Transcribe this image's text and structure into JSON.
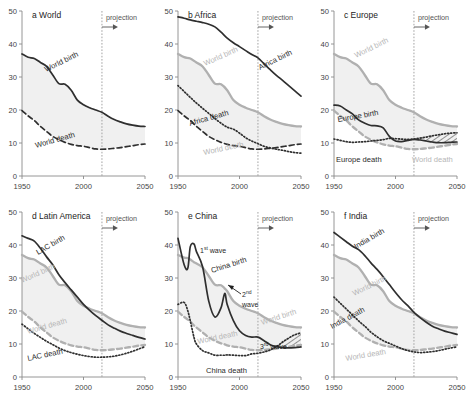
{
  "figure": {
    "width": 469,
    "height": 403,
    "projection_label": "projection",
    "projection_year": 2015,
    "xlim": [
      1950,
      2050
    ],
    "ylim": [
      0,
      50
    ],
    "xticks": [
      1950,
      2000,
      2050
    ],
    "yticks": [
      0,
      10,
      20,
      30,
      40,
      50
    ],
    "colors": {
      "dark": "#2f2f2f",
      "gray": "#b0b0b0",
      "fill": "#f0f0f0",
      "axis": "#8a8a8a"
    }
  },
  "chart_data": [
    {
      "type": "line",
      "panel": "a",
      "title": "a World",
      "xlabel": "",
      "ylabel": "",
      "xlim": [
        1950,
        2050
      ],
      "ylim": [
        0,
        50
      ],
      "grid": false,
      "legend": "inline-labels",
      "x": [
        1950,
        1955,
        1960,
        1965,
        1970,
        1975,
        1980,
        1985,
        1990,
        1995,
        2000,
        2005,
        2010,
        2015,
        2020,
        2025,
        2030,
        2035,
        2040,
        2045,
        2050
      ],
      "series": [
        {
          "name": "World birth",
          "style": "solid-dark",
          "values": [
            37.0,
            36.0,
            35.6,
            34.4,
            33.2,
            30.6,
            28.0,
            27.8,
            26.0,
            23.0,
            21.6,
            20.7,
            20.0,
            19.3,
            18.1,
            17.1,
            16.4,
            15.8,
            15.4,
            15.1,
            15.0
          ]
        },
        {
          "name": "World death",
          "style": "dashed-dark",
          "values": [
            19.8,
            18.2,
            16.8,
            15.0,
            13.5,
            12.0,
            11.0,
            10.2,
            9.6,
            9.2,
            9.0,
            8.6,
            8.2,
            8.1,
            8.2,
            8.4,
            8.6,
            8.9,
            9.2,
            9.5,
            9.7
          ]
        }
      ]
    },
    {
      "type": "line",
      "panel": "b",
      "title": "b Africa",
      "xlim": [
        1950,
        2050
      ],
      "ylim": [
        0,
        50
      ],
      "grid": false,
      "x": [
        1950,
        1955,
        1960,
        1965,
        1970,
        1975,
        1980,
        1985,
        1990,
        1995,
        2000,
        2005,
        2010,
        2015,
        2020,
        2025,
        2030,
        2035,
        2040,
        2045,
        2050
      ],
      "series": [
        {
          "name": "Africa birth",
          "style": "solid-dark",
          "values": [
            48.2,
            47.8,
            47.3,
            46.9,
            46.5,
            46.0,
            45.2,
            43.6,
            41.8,
            40.4,
            39.2,
            38.0,
            36.8,
            35.8,
            34.0,
            32.2,
            30.5,
            29.0,
            27.4,
            25.8,
            24.2
          ]
        },
        {
          "name": "Africa death",
          "style": "dotted-dark",
          "values": [
            27.4,
            25.6,
            23.8,
            22.1,
            20.5,
            19.0,
            17.4,
            16.0,
            14.8,
            14.2,
            13.0,
            11.6,
            10.6,
            9.8,
            9.0,
            8.5,
            8.1,
            7.8,
            7.4,
            7.1,
            6.9
          ]
        },
        {
          "name": "World birth",
          "style": "solid-gray",
          "values": [
            37.0,
            36.0,
            35.6,
            34.4,
            33.2,
            30.6,
            28.0,
            27.8,
            26.0,
            23.0,
            21.6,
            20.7,
            20.0,
            19.3,
            18.1,
            17.1,
            16.4,
            15.8,
            15.4,
            15.1,
            15.0
          ]
        },
        {
          "name": "World death",
          "style": "dashed-dark",
          "values": [
            19.8,
            18.2,
            16.8,
            15.0,
            13.5,
            12.0,
            11.0,
            10.2,
            9.6,
            9.2,
            9.0,
            8.6,
            8.2,
            8.1,
            8.2,
            8.4,
            8.6,
            8.9,
            9.2,
            9.5,
            9.7
          ]
        }
      ]
    },
    {
      "type": "line",
      "panel": "c",
      "title": "c Europe",
      "xlim": [
        1950,
        2050
      ],
      "ylim": [
        0,
        50
      ],
      "grid": false,
      "hatched_region": "death exceeds birth after 2000",
      "x": [
        1950,
        1955,
        1960,
        1965,
        1970,
        1975,
        1980,
        1985,
        1990,
        1995,
        2000,
        2005,
        2010,
        2015,
        2020,
        2025,
        2030,
        2035,
        2040,
        2045,
        2050
      ],
      "series": [
        {
          "name": "Europe birth",
          "style": "solid-dark",
          "values": [
            21.5,
            21.2,
            20.0,
            18.8,
            17.0,
            16.0,
            15.3,
            15.2,
            14.6,
            12.0,
            10.6,
            10.4,
            10.8,
            11.1,
            10.9,
            10.6,
            10.3,
            10.1,
            10.1,
            10.2,
            10.3
          ]
        },
        {
          "name": "Europe death",
          "style": "dotted-dark",
          "values": [
            11.2,
            10.8,
            10.4,
            10.2,
            10.3,
            10.4,
            10.6,
            10.8,
            11.0,
            11.4,
            11.3,
            11.2,
            11.1,
            11.2,
            11.5,
            11.8,
            12.2,
            12.5,
            12.8,
            13.0,
            13.1
          ]
        },
        {
          "name": "World birth",
          "style": "solid-gray",
          "values": [
            37.0,
            36.0,
            35.6,
            34.4,
            33.2,
            30.6,
            28.0,
            27.8,
            26.0,
            23.0,
            21.6,
            20.7,
            20.0,
            19.3,
            18.1,
            17.1,
            16.4,
            15.8,
            15.4,
            15.1,
            15.0
          ]
        },
        {
          "name": "World death",
          "style": "dashed-gray",
          "values": [
            19.8,
            18.2,
            16.8,
            15.0,
            13.5,
            12.0,
            11.0,
            10.2,
            9.6,
            9.2,
            9.0,
            8.6,
            8.2,
            8.1,
            8.2,
            8.4,
            8.6,
            8.9,
            9.2,
            9.5,
            9.7
          ]
        }
      ]
    },
    {
      "type": "line",
      "panel": "d",
      "title": "d Latin America",
      "xlim": [
        1950,
        2050
      ],
      "ylim": [
        0,
        50
      ],
      "grid": false,
      "x": [
        1950,
        1955,
        1960,
        1965,
        1970,
        1975,
        1980,
        1985,
        1990,
        1995,
        2000,
        2005,
        2010,
        2015,
        2020,
        2025,
        2030,
        2035,
        2040,
        2045,
        2050
      ],
      "series": [
        {
          "name": "LAC birth",
          "style": "solid-dark",
          "values": [
            42.8,
            42.0,
            41.2,
            39.0,
            36.4,
            34.0,
            31.0,
            28.6,
            26.4,
            24.2,
            22.0,
            20.2,
            18.6,
            17.2,
            15.8,
            14.8,
            13.9,
            13.2,
            12.6,
            12.0,
            11.5
          ]
        },
        {
          "name": "LAC death",
          "style": "dotted-dark",
          "values": [
            16.0,
            14.6,
            13.2,
            12.0,
            10.8,
            9.8,
            8.8,
            8.0,
            7.4,
            6.9,
            6.5,
            6.2,
            6.0,
            6.0,
            6.1,
            6.3,
            6.7,
            7.2,
            7.8,
            8.5,
            9.2
          ]
        },
        {
          "name": "World birth",
          "style": "solid-gray",
          "values": [
            37.0,
            36.0,
            35.6,
            34.4,
            33.2,
            30.6,
            28.0,
            27.8,
            26.0,
            23.0,
            21.6,
            20.7,
            20.0,
            19.3,
            18.1,
            17.1,
            16.4,
            15.8,
            15.4,
            15.1,
            15.0
          ]
        },
        {
          "name": "World death",
          "style": "dashed-gray",
          "values": [
            19.8,
            18.2,
            16.8,
            15.0,
            13.5,
            12.0,
            11.0,
            10.2,
            9.6,
            9.2,
            9.0,
            8.6,
            8.2,
            8.1,
            8.2,
            8.4,
            8.6,
            8.9,
            9.2,
            9.5,
            9.7
          ]
        }
      ]
    },
    {
      "type": "line",
      "panel": "e",
      "title": "e China",
      "xlim": [
        1950,
        2050
      ],
      "ylim": [
        0,
        50
      ],
      "grid": false,
      "annotations": [
        "1st wave",
        "2nd wave",
        "3rd wave"
      ],
      "x": [
        1950,
        1955,
        1958,
        1960,
        1963,
        1965,
        1970,
        1975,
        1980,
        1985,
        1988,
        1990,
        1995,
        2000,
        2005,
        2010,
        2015,
        2020,
        2025,
        2030,
        2035,
        2040,
        2045,
        2050
      ],
      "series": [
        {
          "name": "China birth",
          "style": "solid-dark",
          "values": [
            42.0,
            34.0,
            33.0,
            39.5,
            40.3,
            38.0,
            33.4,
            23.0,
            18.2,
            21.0,
            25.3,
            22.0,
            17.1,
            14.0,
            12.6,
            12.1,
            12.1,
            11.0,
            9.8,
            9.2,
            8.9,
            8.8,
            8.9,
            9.1
          ]
        },
        {
          "name": "China death",
          "style": "dotted-dark",
          "values": [
            22.0,
            22.6,
            20.0,
            17.0,
            12.0,
            10.0,
            8.0,
            7.3,
            6.6,
            6.6,
            6.6,
            6.7,
            6.6,
            6.5,
            6.5,
            7.0,
            7.2,
            7.6,
            8.2,
            9.2,
            10.6,
            11.8,
            12.8,
            13.4
          ]
        },
        {
          "name": "World birth",
          "style": "solid-gray",
          "values": [
            37.0,
            36.2,
            36.0,
            35.6,
            34.8,
            34.4,
            33.2,
            30.6,
            28.0,
            27.8,
            26.8,
            26.0,
            23.0,
            21.6,
            20.7,
            20.0,
            19.3,
            18.1,
            17.1,
            16.4,
            15.8,
            15.4,
            15.1,
            15.0
          ]
        },
        {
          "name": "World death",
          "style": "dashed-gray",
          "values": [
            19.8,
            18.2,
            17.4,
            16.8,
            15.6,
            15.0,
            13.5,
            12.0,
            11.0,
            10.2,
            9.9,
            9.6,
            9.2,
            9.0,
            8.6,
            8.2,
            8.1,
            8.2,
            8.4,
            8.6,
            8.9,
            9.2,
            9.5,
            9.7
          ]
        }
      ]
    },
    {
      "type": "line",
      "panel": "f",
      "title": "f India",
      "xlim": [
        1950,
        2050
      ],
      "ylim": [
        0,
        50
      ],
      "grid": false,
      "x": [
        1950,
        1955,
        1960,
        1965,
        1970,
        1975,
        1980,
        1985,
        1990,
        1995,
        2000,
        2005,
        2010,
        2015,
        2020,
        2025,
        2030,
        2035,
        2040,
        2045,
        2050
      ],
      "series": [
        {
          "name": "India birth",
          "style": "solid-dark",
          "values": [
            43.8,
            42.4,
            41.0,
            39.6,
            38.6,
            36.8,
            34.6,
            32.6,
            30.4,
            28.0,
            25.6,
            23.4,
            21.6,
            19.6,
            18.0,
            16.6,
            15.4,
            14.6,
            13.9,
            13.4,
            12.9
          ]
        },
        {
          "name": "India death",
          "style": "dotted-dark",
          "values": [
            24.2,
            22.4,
            20.6,
            18.8,
            17.0,
            15.4,
            13.6,
            12.2,
            11.0,
            10.2,
            9.4,
            8.6,
            8.0,
            7.6,
            7.4,
            7.5,
            7.7,
            8.0,
            8.4,
            8.8,
            9.1
          ]
        },
        {
          "name": "World birth",
          "style": "solid-gray",
          "values": [
            37.0,
            36.0,
            35.6,
            34.4,
            33.2,
            30.6,
            28.0,
            27.8,
            26.0,
            23.0,
            21.6,
            20.7,
            20.0,
            19.3,
            18.1,
            17.1,
            16.4,
            15.8,
            15.4,
            15.1,
            15.0
          ]
        },
        {
          "name": "World death",
          "style": "dashed-gray",
          "values": [
            19.8,
            18.2,
            16.8,
            15.0,
            13.5,
            12.0,
            11.0,
            10.2,
            9.6,
            9.2,
            9.0,
            8.6,
            8.2,
            8.1,
            8.2,
            8.4,
            8.6,
            8.9,
            9.2,
            9.5,
            9.7
          ]
        }
      ]
    }
  ],
  "labels": {
    "a": [
      {
        "text": "World birth",
        "x": 46,
        "y": 72,
        "rot": -26,
        "tone": "dark"
      },
      {
        "text": "World death",
        "x": 36,
        "y": 148,
        "rot": -16,
        "tone": "dark"
      }
    ],
    "b": [
      {
        "text": "Africa birth",
        "x": 104,
        "y": 70,
        "rot": -26,
        "tone": "dark"
      },
      {
        "text": "Africa death",
        "x": 34,
        "y": 126,
        "rot": -16,
        "tone": "dark"
      },
      {
        "text": "World birth",
        "x": 49,
        "y": 66,
        "rot": -24,
        "tone": "gray"
      },
      {
        "text": "World death",
        "x": 48,
        "y": 155,
        "rot": -12,
        "tone": "gray"
      }
    ],
    "c": [
      {
        "text": "World birth",
        "x": 44,
        "y": 58,
        "rot": -26,
        "tone": "gray"
      },
      {
        "text": "Europe birth",
        "x": 26,
        "y": 122,
        "rot": -10,
        "tone": "dark"
      },
      {
        "text": "Europe death",
        "x": 24,
        "y": 162,
        "rot": 0,
        "tone": "dark"
      },
      {
        "text": "World death",
        "x": 100,
        "y": 162,
        "rot": 0,
        "tone": "gray"
      }
    ],
    "d": [
      {
        "text": "LAC birth",
        "x": 38,
        "y": 54,
        "rot": -30,
        "tone": "dark"
      },
      {
        "text": "World birth",
        "x": 22,
        "y": 82,
        "rot": -24,
        "tone": "gray"
      },
      {
        "text": "World death",
        "x": 28,
        "y": 133,
        "rot": -16,
        "tone": "gray"
      },
      {
        "text": "LAC death",
        "x": 28,
        "y": 160,
        "rot": -12,
        "tone": "dark"
      }
    ],
    "e": [
      {
        "text": "China birth",
        "x": 56,
        "y": 72,
        "rot": -18,
        "tone": "dark"
      },
      {
        "text": "China death",
        "x": 50,
        "y": 172,
        "rot": 0,
        "tone": "dark"
      },
      {
        "text": "World birth",
        "x": 106,
        "y": 124,
        "rot": -18,
        "tone": "gray"
      },
      {
        "text": "World death",
        "x": 42,
        "y": 143,
        "rot": -12,
        "tone": "gray"
      }
    ],
    "f": [
      {
        "text": "India birth",
        "x": 44,
        "y": 48,
        "rot": -30,
        "tone": "dark"
      },
      {
        "text": "World birth",
        "x": 42,
        "y": 95,
        "rot": -26,
        "tone": "gray"
      },
      {
        "text": "India death",
        "x": 20,
        "y": 128,
        "rot": -28,
        "tone": "dark"
      },
      {
        "text": "World death",
        "x": 34,
        "y": 160,
        "rot": -10,
        "tone": "gray"
      }
    ]
  },
  "wave_labels": [
    {
      "text": "1",
      "sup": "st",
      "rest": " wave",
      "x": 44,
      "y": 52
    },
    {
      "text": "2",
      "sup": "nd",
      "rest": "",
      "x": 86,
      "y": 96
    },
    {
      "text": "",
      "sup": "",
      "rest": "wave",
      "x": 86,
      "y": 106
    },
    {
      "text": "3",
      "sup": "rd",
      "rest": " wave",
      "x": 104,
      "y": 148
    }
  ]
}
